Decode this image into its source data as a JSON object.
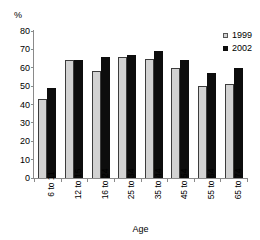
{
  "chart_data": {
    "type": "bar",
    "title": "",
    "xlabel": "Age",
    "ylabel": "%",
    "ylim": [
      0,
      80
    ],
    "yticks": [
      0,
      10,
      20,
      30,
      40,
      50,
      60,
      70,
      80
    ],
    "grid": false,
    "legend_position": "top-right",
    "categories": [
      "6 to 11",
      "12 to 15",
      "16 to 24",
      "25 to 34",
      "35 to 44",
      "45 to 54",
      "55 to 64",
      "65 to 74"
    ],
    "series": [
      {
        "name": "1999",
        "color": "#d2d2d2",
        "values": [
          43,
          64,
          58,
          66,
          65,
          60,
          50,
          51
        ]
      },
      {
        "name": "2002",
        "color": "#0d0d0d",
        "values": [
          49,
          64,
          66,
          67,
          69,
          64,
          57,
          60
        ]
      }
    ]
  },
  "legend": {
    "items": [
      {
        "label": "1999",
        "swatch": "legend-swatch-1999"
      },
      {
        "label": "2002",
        "swatch": "legend-swatch-2002"
      }
    ]
  }
}
